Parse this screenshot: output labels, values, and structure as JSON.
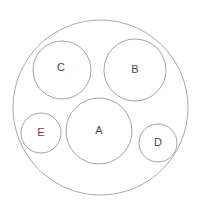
{
  "canvas": {
    "width": 209,
    "height": 217,
    "background_color": "#ffffff"
  },
  "style": {
    "stroke_color": "#a9a9a9",
    "stroke_color_inner": "#a3a3a3",
    "stroke_width": 1,
    "label_color": "#4a4a4a",
    "fill_color": "none"
  },
  "diagram": {
    "type": "circle-packing",
    "title": "",
    "outer_circle": {
      "name": "outer-boundary-circle",
      "label": "",
      "cx": 100.5,
      "cy": 107.5,
      "r": 87.5
    },
    "inner_circles": [
      {
        "id": "A",
        "label": "A",
        "cx": 99,
        "cy": 131,
        "r": 33,
        "label_x": 99,
        "label_y": 131,
        "label_size": 11
      },
      {
        "id": "B",
        "label": "B",
        "cx": 135,
        "cy": 70,
        "r": 31,
        "label_x": 135,
        "label_y": 70,
        "label_size": 11
      },
      {
        "id": "C",
        "label": "C",
        "cx": 62,
        "cy": 70,
        "r": 29,
        "label_x": 61,
        "label_y": 68,
        "label_size": 11
      },
      {
        "id": "D",
        "label": "D",
        "cx": 158,
        "cy": 143,
        "r": 19,
        "label_x": 158,
        "label_y": 143,
        "label_size": 11
      },
      {
        "id": "E",
        "label": "E",
        "cx": 41,
        "cy": 133,
        "r": 20,
        "label_x": 41,
        "label_y": 133,
        "label_size": 11
      }
    ]
  }
}
